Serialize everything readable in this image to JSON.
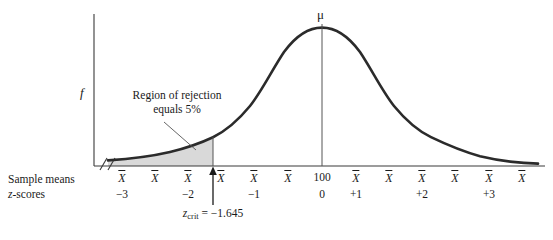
{
  "figure": {
    "title_faint": "",
    "curve_color": "#2b2b2b",
    "shade_color": "#d9d9d9",
    "axis_color": "#3a3a3a"
  },
  "axes": {
    "y_label": "f",
    "mean_label": "μ",
    "row_labels": {
      "sample_means": "Sample means",
      "z_scores": "z-scores"
    },
    "mean_value_label": "100",
    "xbar_symbol": "X",
    "ticks": [
      {
        "x": 122,
        "type": "xbar",
        "z": "−3"
      },
      {
        "x": 155,
        "type": "xbar",
        "z": ""
      },
      {
        "x": 188,
        "type": "xbar",
        "z": "−2"
      },
      {
        "x": 221,
        "type": "xbar",
        "z": ""
      },
      {
        "x": 254,
        "type": "xbar",
        "z": "−1"
      },
      {
        "x": 288,
        "type": "xbar",
        "z": ""
      },
      {
        "x": 322,
        "type": "value",
        "z": "0"
      },
      {
        "x": 356,
        "type": "xbar",
        "z": "+1"
      },
      {
        "x": 389,
        "type": "xbar",
        "z": ""
      },
      {
        "x": 422,
        "type": "xbar",
        "z": "+2"
      },
      {
        "x": 455,
        "type": "xbar",
        "z": ""
      },
      {
        "x": 489,
        "type": "xbar",
        "z": "+3"
      },
      {
        "x": 522,
        "type": "xbar",
        "z": ""
      }
    ]
  },
  "annotations": {
    "rejection_line1": "Region of rejection",
    "rejection_line2": "equals 5%",
    "zcrit_label": "z",
    "zcrit_sub": "crit",
    "zcrit_value": " = −1.645",
    "zcrit_x": 213
  },
  "chart_data": {
    "type": "line",
    "title": "Region of rejection equals 5%",
    "xlabel": "z-scores",
    "ylabel": "f",
    "distribution": "normal",
    "mean": 100,
    "mean_z": 0,
    "critical_value_z": -1.645,
    "tail": "left",
    "alpha": 0.05,
    "xlim": [
      -3.5,
      3.5
    ],
    "x_tick_z": [
      "−3",
      "−2",
      "−1",
      "0",
      "+1",
      "+2",
      "+3"
    ],
    "x_tick_means": [
      "X",
      "X",
      "X",
      "100",
      "X",
      "X",
      "X"
    ],
    "shaded_region": {
      "from_z": -3.5,
      "to_z": -1.645,
      "area": 0.05
    },
    "grid": false,
    "legend": "none"
  }
}
